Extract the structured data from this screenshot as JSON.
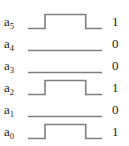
{
  "diagram": {
    "type": "timing-diagram",
    "line_color": "#7f7f7f",
    "text_color": "#231f20",
    "background_color": "#ffffff",
    "rows": [
      {
        "label_base": "a",
        "label_sub": "5",
        "value": "1",
        "waveform": "pulse",
        "pulse_start_pct": 23,
        "pulse_end_pct": 78
      },
      {
        "label_base": "a",
        "label_sub": "4",
        "value": "0",
        "waveform": "flat-low",
        "pulse_start_pct": 0,
        "pulse_end_pct": 0
      },
      {
        "label_base": "a",
        "label_sub": "3",
        "value": "0",
        "waveform": "flat-low",
        "pulse_start_pct": 0,
        "pulse_end_pct": 0
      },
      {
        "label_base": "a",
        "label_sub": "2",
        "value": "1",
        "waveform": "pulse",
        "pulse_start_pct": 23,
        "pulse_end_pct": 78
      },
      {
        "label_base": "a",
        "label_sub": "1",
        "value": "0",
        "waveform": "flat-low",
        "pulse_start_pct": 0,
        "pulse_end_pct": 0
      },
      {
        "label_base": "a",
        "label_sub": "0",
        "value": "1",
        "waveform": "pulse",
        "pulse_start_pct": 23,
        "pulse_end_pct": 78
      }
    ]
  },
  "chart_data": {
    "type": "line",
    "xlabel": "",
    "ylabel": "",
    "categories": [
      "a5",
      "a4",
      "a3",
      "a2",
      "a1",
      "a0"
    ],
    "values": [
      1,
      0,
      0,
      1,
      0,
      1
    ],
    "series": [
      {
        "name": "a5",
        "values": [
          0,
          0,
          1,
          1,
          0,
          0
        ]
      },
      {
        "name": "a4",
        "values": [
          0,
          0,
          0,
          0,
          0,
          0
        ]
      },
      {
        "name": "a3",
        "values": [
          0,
          0,
          0,
          0,
          0,
          0
        ]
      },
      {
        "name": "a2",
        "values": [
          0,
          0,
          1,
          1,
          0,
          0
        ]
      },
      {
        "name": "a1",
        "values": [
          0,
          0,
          0,
          0,
          0,
          0
        ]
      },
      {
        "name": "a0",
        "values": [
          0,
          0,
          1,
          1,
          0,
          0
        ]
      }
    ],
    "x": [
      0,
      23,
      23,
      78,
      78,
      100
    ],
    "ylim": [
      0,
      1
    ],
    "grid": false,
    "legend": "none"
  }
}
